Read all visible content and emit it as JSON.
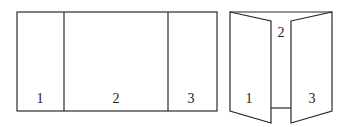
{
  "flat_brochure": {
    "panels": [
      {
        "label": "1"
      },
      {
        "label": "2"
      },
      {
        "label": "3"
      }
    ]
  },
  "folded_brochure": {
    "panels": [
      {
        "label": "1"
      },
      {
        "label": "2"
      },
      {
        "label": "3"
      }
    ]
  }
}
